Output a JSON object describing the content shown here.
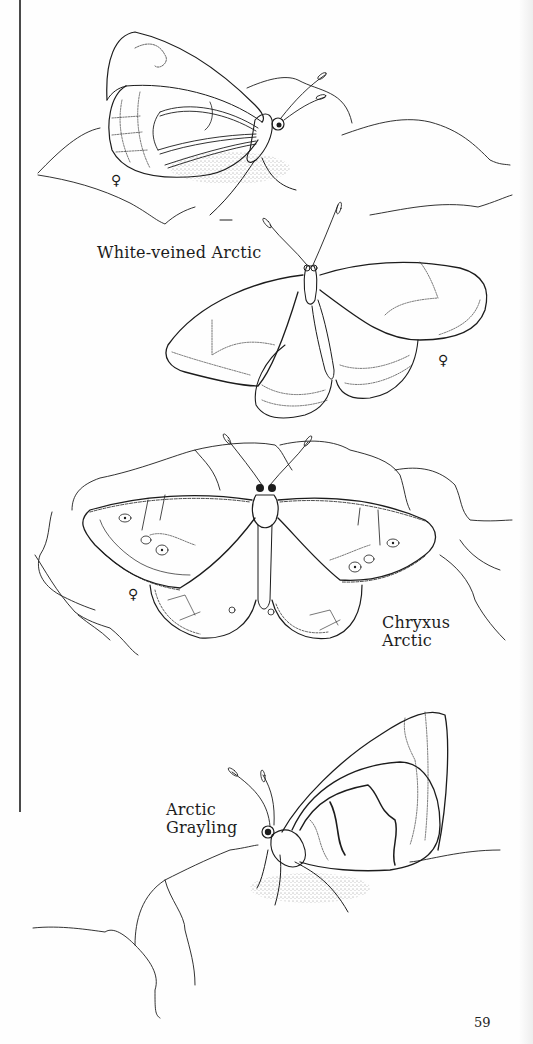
{
  "page": {
    "number": "59",
    "ink_color": "#1c1c1c",
    "paper_color": "#fefefe"
  },
  "illustrations": [
    {
      "id": "white-veined-arctic-side",
      "caption": "",
      "view": "side view, wings closed, perched on rock",
      "sex_symbol": "♀"
    },
    {
      "id": "white-veined-arctic-open",
      "caption": "White-veined Arctic",
      "view": "dorsal view, wings open",
      "sex_symbol": "♀"
    },
    {
      "id": "chryxus-arctic",
      "caption_line1": "Chryxus",
      "caption_line2": "Arctic",
      "view": "dorsal view, wings open on rocks",
      "sex_symbol": "♀"
    },
    {
      "id": "arctic-grayling",
      "caption_line1": "Arctic",
      "caption_line2": "Grayling",
      "view": "side view, wings closed, perched on rock"
    }
  ]
}
